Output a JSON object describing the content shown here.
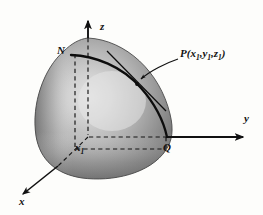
{
  "figure": {
    "type": "3d-geometry-diagram",
    "background_color": "#fdfdfb",
    "axes": {
      "z_label": "z",
      "y_label": "y",
      "x_label": "x",
      "origin_label": "O"
    },
    "points": {
      "north_label": "N",
      "q_label": "Q",
      "x1_label": "x",
      "x1_sub": "1"
    },
    "p_label": {
      "name": "P",
      "open_paren": "(",
      "c1": "x",
      "c1_sub": "1",
      "sep1": ",",
      "c2": "y",
      "c2_sub": "1",
      "sep2": ",",
      "c3": "z",
      "c3_sub": "1",
      "close_paren": ")"
    },
    "colors": {
      "ink": "#111111",
      "sphere_dark": "#6e6e6e",
      "sphere_mid": "#9a9a9a",
      "sphere_light": "#d9d9d9",
      "sphere_edge": "#5a5a5a",
      "dashed": "#1a1a1a"
    },
    "geometry": {
      "origin_x": 88,
      "origin_y": 137,
      "z_axis_top_y": 18,
      "y_axis_right_x": 245,
      "x_axis_end_x": 21,
      "x_axis_end_y": 196,
      "north_pole_x": 88,
      "north_pole_y": 38,
      "q_point_x": 168,
      "q_point_y": 137,
      "p_point_x": 137,
      "p_point_y": 82
    }
  }
}
